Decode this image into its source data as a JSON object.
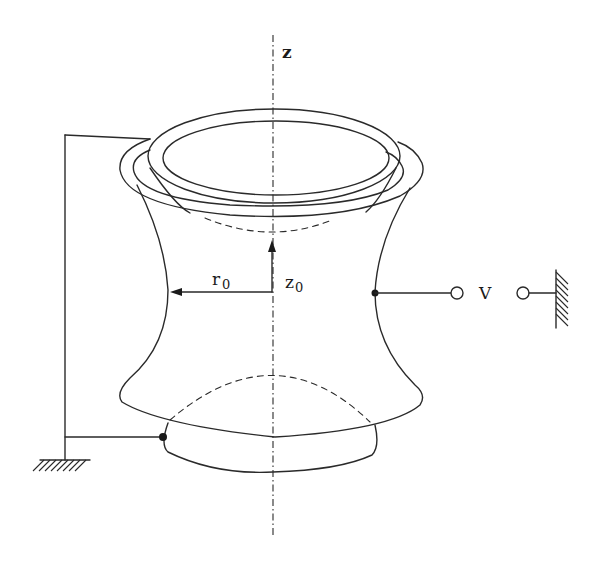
{
  "diagram": {
    "labels": {
      "axis": "z",
      "radius": "r",
      "radius_sub": "0",
      "height": "z",
      "height_sub": "0",
      "voltage": "V"
    },
    "components": [
      "upper-endcap-electrode",
      "ring-electrode",
      "lower-endcap-electrode",
      "symmetry-axis-z",
      "radius-arrow-r0",
      "height-arrow-z0",
      "voltage-source-V",
      "ground-symbol-right",
      "ground-symbol-left",
      "endcap-connection-wire"
    ],
    "colors": {
      "line": "#2a2a2a",
      "background": "#ffffff"
    }
  }
}
